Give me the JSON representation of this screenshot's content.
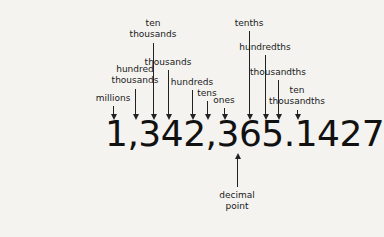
{
  "diagram": {
    "number": "1,342,365.1427",
    "place_values": [
      {
        "label": "millions",
        "x": 113,
        "label_top": 93,
        "line_top": 106
      },
      {
        "label": "hundred\nthousands",
        "x": 135,
        "label_top": 64,
        "line_top": 89
      },
      {
        "label": "ten\nthousands",
        "x": 153,
        "label_top": 18,
        "line_top": 43
      },
      {
        "label": "thousands",
        "x": 168,
        "label_top": 57,
        "line_top": 70
      },
      {
        "label": "hundreds",
        "x": 192,
        "label_top": 77,
        "line_top": 90
      },
      {
        "label": "tens",
        "x": 207,
        "label_top": 88,
        "line_top": 101
      },
      {
        "label": "ones",
        "x": 224,
        "label_top": 95,
        "line_top": 108
      },
      {
        "label": "tenths",
        "x": 249,
        "label_top": 18,
        "line_top": 31
      },
      {
        "label": "hundredths",
        "x": 265,
        "label_top": 42,
        "line_top": 55
      },
      {
        "label": "thousandths",
        "x": 278,
        "label_top": 67,
        "line_top": 80
      },
      {
        "label": "ten\nthousandths",
        "x": 297,
        "label_top": 85,
        "line_top": 110
      }
    ],
    "decimal_point": {
      "label": "decimal\npoint",
      "x": 237
    }
  }
}
